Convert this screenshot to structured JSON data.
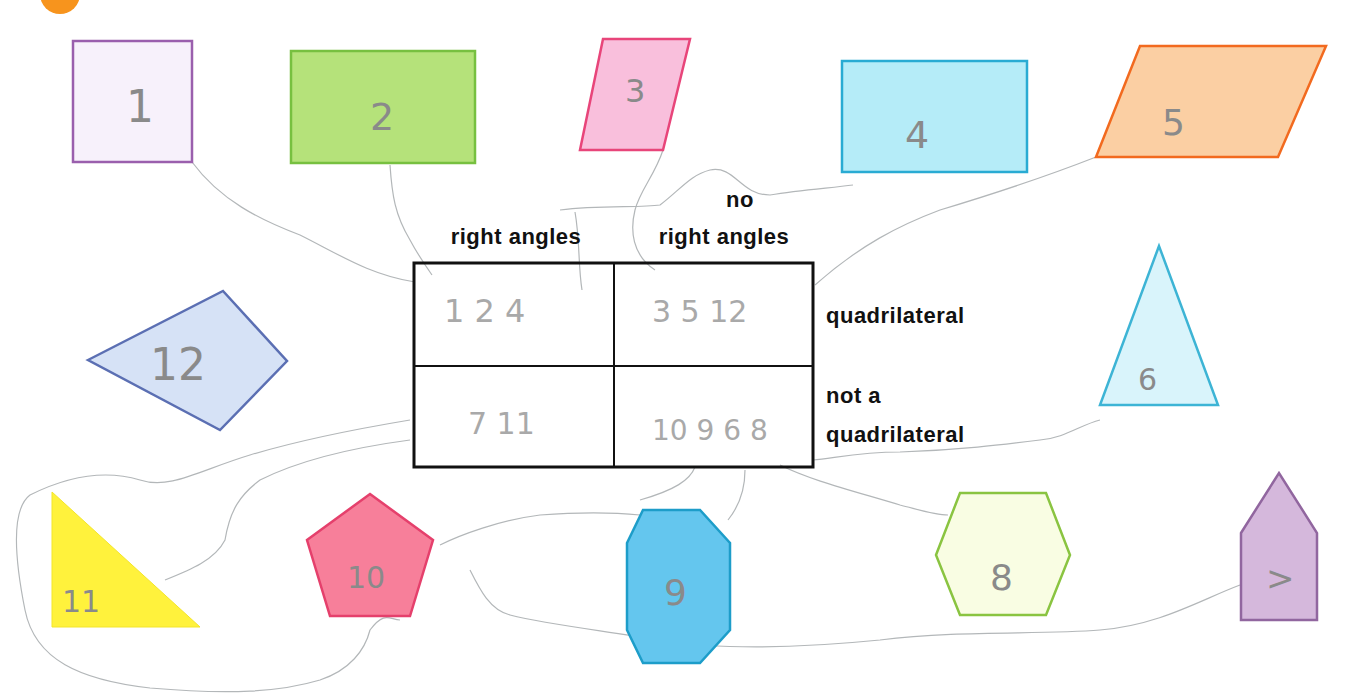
{
  "colors": {
    "badge": "#f7941d",
    "table_border": "#111111",
    "pencil": "#b3b7b9"
  },
  "table": {
    "col_headers": [
      {
        "line1": "",
        "line2": "right angles"
      },
      {
        "line1": "no",
        "line2": "right angles"
      }
    ],
    "row_headers": [
      {
        "line1": "quadrilateral",
        "line2": ""
      },
      {
        "line1": "not a",
        "line2": "quadrilateral"
      }
    ],
    "cells": {
      "quad_right": "1 2 4",
      "quad_noright": "3 5 12",
      "notquad_right": "7 11",
      "notquad_noright": "10 9 6 8"
    }
  },
  "shapes": [
    {
      "id": "1",
      "label": "1",
      "kind": "square",
      "fill": "#f7f1fb",
      "stroke": "#9a5fad"
    },
    {
      "id": "2",
      "label": "2",
      "kind": "rectangle",
      "fill": "#b5e27a",
      "stroke": "#77c040"
    },
    {
      "id": "3",
      "label": "3",
      "kind": "rhombus",
      "fill": "#f9bfdc",
      "stroke": "#e8457a"
    },
    {
      "id": "4",
      "label": "4",
      "kind": "rectangle",
      "fill": "#b5ecf8",
      "stroke": "#29abd3"
    },
    {
      "id": "5",
      "label": "5",
      "kind": "parallelogram",
      "fill": "#fbcfa3",
      "stroke": "#f26a1f"
    },
    {
      "id": "6",
      "label": "6",
      "kind": "isosceles-triangle",
      "fill": "#d9f4fb",
      "stroke": "#3db4d5"
    },
    {
      "id": "7",
      "label": ">",
      "kind": "pentagon-house",
      "fill": "#d5b8dc",
      "stroke": "#91669f"
    },
    {
      "id": "8",
      "label": "8",
      "kind": "hexagon",
      "fill": "#f9fde3",
      "stroke": "#8ac441"
    },
    {
      "id": "9",
      "label": "9",
      "kind": "octagon",
      "fill": "#64c6ee",
      "stroke": "#1d9dc9"
    },
    {
      "id": "10",
      "label": "10",
      "kind": "pentagon",
      "fill": "#f77f9a",
      "stroke": "#e5406c"
    },
    {
      "id": "11",
      "label": "11",
      "kind": "right-triangle",
      "fill": "#fff23c",
      "stroke": "#fff23c"
    },
    {
      "id": "12",
      "label": "12",
      "kind": "kite",
      "fill": "#d6e2f6",
      "stroke": "#5b6fb3"
    }
  ]
}
